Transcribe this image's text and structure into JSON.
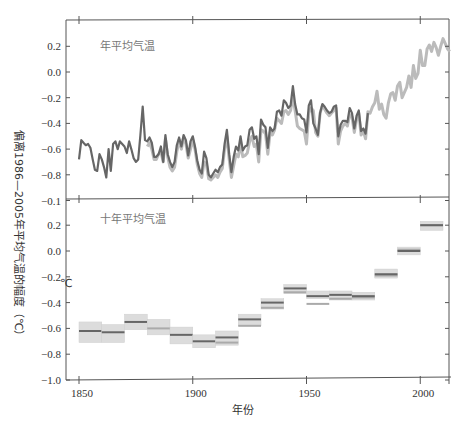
{
  "chart_data": [
    {
      "type": "line",
      "title": "年平均气温",
      "xlabel": "年份",
      "ylabel": "偏离1986—2005年平均气温的幅度（℃）",
      "xlim": [
        1845,
        2014
      ],
      "ylim": [
        -1.0,
        0.4
      ],
      "yticks": [
        0.2,
        0.0,
        -0.2,
        -0.4,
        -0.6,
        -0.8,
        -1.0
      ],
      "ytick_labels": [
        "0.2",
        "0.0",
        "−0.2",
        "−0.4",
        "−0.6",
        "−0.8",
        "−0.1"
      ],
      "xticks": [
        1850,
        1900,
        1950,
        2000
      ],
      "grid": false,
      "legend": null,
      "series": [
        {
          "name": "dataset-dark",
          "color": "#666666",
          "x": [
            1850,
            1851,
            1852,
            1853,
            1854,
            1855,
            1856,
            1857,
            1858,
            1859,
            1860,
            1861,
            1862,
            1863,
            1864,
            1865,
            1866,
            1867,
            1868,
            1869,
            1870,
            1871,
            1872,
            1873,
            1874,
            1875,
            1876,
            1877,
            1878,
            1879,
            1880,
            1881,
            1882,
            1883,
            1884,
            1885,
            1886,
            1887,
            1888,
            1889,
            1890,
            1891,
            1892,
            1893,
            1894,
            1895,
            1896,
            1897,
            1898,
            1899,
            1900,
            1901,
            1902,
            1903,
            1904,
            1905,
            1906,
            1907,
            1908,
            1909,
            1910,
            1911,
            1912,
            1913,
            1914,
            1915,
            1916,
            1917,
            1918,
            1919,
            1920,
            1921,
            1922,
            1923,
            1924,
            1925,
            1926,
            1927,
            1928,
            1929,
            1930,
            1931,
            1932,
            1933,
            1934,
            1935,
            1936,
            1937,
            1938,
            1939,
            1940,
            1941,
            1942,
            1943,
            1944,
            1945,
            1946,
            1947,
            1948,
            1949,
            1950,
            1951,
            1952,
            1953,
            1954,
            1955,
            1956,
            1957,
            1958,
            1959,
            1960,
            1961,
            1962,
            1963,
            1964,
            1965,
            1966,
            1967,
            1968,
            1969,
            1970,
            1971,
            1972,
            1973,
            1974,
            1975,
            1976,
            1977,
            1978,
            1979,
            1980,
            1981,
            1982,
            1983,
            1984,
            1985,
            1986,
            1987,
            1988,
            1989,
            1990,
            1991,
            1992,
            1993,
            1994,
            1995,
            1996,
            1997,
            1998,
            1999,
            2000,
            2001,
            2002,
            2003,
            2004,
            2005,
            2006,
            2007,
            2008,
            2009,
            2010
          ],
          "values": [
            -0.68,
            -0.53,
            -0.55,
            -0.57,
            -0.56,
            -0.59,
            -0.68,
            -0.76,
            -0.77,
            -0.64,
            -0.68,
            -0.74,
            -0.82,
            -0.6,
            -0.77,
            -0.56,
            -0.54,
            -0.6,
            -0.54,
            -0.56,
            -0.58,
            -0.63,
            -0.54,
            -0.6,
            -0.67,
            -0.7,
            -0.68,
            -0.49,
            -0.27,
            -0.53,
            -0.54,
            -0.51,
            -0.55,
            -0.66,
            -0.66,
            -0.64,
            -0.58,
            -0.7,
            -0.49,
            -0.64,
            -0.7,
            -0.74,
            -0.7,
            -0.57,
            -0.51,
            -0.58,
            -0.49,
            -0.53,
            -0.65,
            -0.54,
            -0.5,
            -0.58,
            -0.69,
            -0.76,
            -0.79,
            -0.62,
            -0.67,
            -0.8,
            -0.82,
            -0.79,
            -0.76,
            -0.78,
            -0.74,
            -0.72,
            -0.56,
            -0.45,
            -0.64,
            -0.78,
            -0.66,
            -0.58,
            -0.61,
            -0.5,
            -0.61,
            -0.58,
            -0.57,
            -0.45,
            -0.43,
            -0.52,
            -0.5,
            -0.64,
            -0.37,
            -0.41,
            -0.43,
            -0.59,
            -0.43,
            -0.46,
            -0.44,
            -0.31,
            -0.3,
            -0.34,
            -0.22,
            -0.24,
            -0.28,
            -0.26,
            -0.11,
            -0.25,
            -0.33,
            -0.33,
            -0.36,
            -0.37,
            -0.47,
            -0.26,
            -0.22,
            -0.4,
            -0.44,
            -0.49,
            -0.32,
            -0.25,
            -0.27,
            -0.3,
            -0.32,
            -0.31,
            -0.27,
            -0.26,
            -0.5,
            -0.41,
            -0.38,
            -0.38,
            -0.39,
            -0.28,
            -0.32,
            -0.44,
            -0.34,
            -0.3,
            -0.46,
            -0.44,
            -0.48,
            -0.32
          ],
          "note": "dark series ends ~1977; values estimated from pixels"
        },
        {
          "name": "dataset-light",
          "color": "#bbbbbb",
          "x_start": 1880,
          "x_end": 2010,
          "values": [
            -0.58,
            -0.55,
            -0.6,
            -0.68,
            -0.68,
            -0.64,
            -0.62,
            -0.7,
            -0.52,
            -0.66,
            -0.74,
            -0.77,
            -0.74,
            -0.62,
            -0.53,
            -0.6,
            -0.51,
            -0.56,
            -0.67,
            -0.6,
            -0.53,
            -0.6,
            -0.72,
            -0.79,
            -0.82,
            -0.7,
            -0.72,
            -0.83,
            -0.84,
            -0.82,
            -0.8,
            -0.82,
            -0.78,
            -0.75,
            -0.6,
            -0.5,
            -0.68,
            -0.82,
            -0.73,
            -0.64,
            -0.66,
            -0.56,
            -0.66,
            -0.65,
            -0.63,
            -0.54,
            -0.5,
            -0.58,
            -0.56,
            -0.7,
            -0.45,
            -0.46,
            -0.48,
            -0.64,
            -0.47,
            -0.49,
            -0.45,
            -0.36,
            -0.38,
            -0.4,
            -0.31,
            -0.3,
            -0.33,
            -0.3,
            -0.19,
            -0.3,
            -0.42,
            -0.44,
            -0.45,
            -0.46,
            -0.56,
            -0.32,
            -0.28,
            -0.3,
            -0.47,
            -0.5,
            -0.32,
            -0.26,
            -0.29,
            -0.32,
            -0.34,
            -0.32,
            -0.3,
            -0.28,
            -0.56,
            -0.46,
            -0.42,
            -0.4,
            -0.42,
            -0.33,
            -0.35,
            -0.47,
            -0.37,
            -0.32,
            -0.49,
            -0.46,
            -0.52,
            -0.31,
            -0.32,
            -0.27,
            -0.24,
            -0.15,
            -0.29,
            -0.25,
            -0.33,
            -0.36,
            -0.24,
            -0.17,
            -0.16,
            -0.22,
            -0.11,
            -0.08,
            -0.2,
            -0.16,
            -0.12,
            -0.03,
            -0.12,
            0.05,
            -0.05,
            -0.01,
            0.17,
            0.05,
            0.05,
            0.18,
            0.21,
            0.16,
            0.23,
            0.19,
            0.13,
            0.2,
            0.26,
            0.22,
            0.18,
            0.16
          ]
        }
      ]
    },
    {
      "type": "bar",
      "subtype": "decadal-range-boxes",
      "title": "十年平均气温",
      "xlabel": "年份",
      "ylabel": "偏离1986—2005年平均气温的幅度（℃）",
      "unit_label": "℃",
      "xlim": [
        1845,
        2014
      ],
      "ylim": [
        -1.0,
        0.3
      ],
      "yticks": [
        0.2,
        0.0,
        -0.2,
        -0.4,
        -0.6,
        -0.8,
        -1.0
      ],
      "ytick_labels": [
        "0.2",
        "0.0",
        "−0.2",
        "−0.4",
        "−0.6",
        "−0.8",
        "−1.0"
      ],
      "xticks": [
        1850,
        1900,
        1950,
        2000
      ],
      "xtick_labels": [
        "1850",
        "1900",
        "1950",
        "2000"
      ],
      "categories": [
        "1850s",
        "1860s",
        "1870s",
        "1880s",
        "1890s",
        "1900s",
        "1910s",
        "1920s",
        "1930s",
        "1940s",
        "1950s",
        "1960s",
        "1970s",
        "1980s",
        "1990s",
        "2000s"
      ],
      "decade_start": [
        1850,
        1860,
        1870,
        1880,
        1890,
        1900,
        1910,
        1920,
        1930,
        1940,
        1950,
        1960,
        1970,
        1980,
        1990,
        2000
      ],
      "series": [
        {
          "name": "decadal-mean-dark",
          "color": "#666666",
          "values": [
            -0.62,
            -0.63,
            -0.55,
            null,
            -0.65,
            -0.7,
            -0.67,
            -0.53,
            -0.4,
            -0.29,
            -0.35,
            -0.34,
            -0.35,
            -0.18,
            0.0,
            0.2
          ]
        },
        {
          "name": "decadal-mean-light",
          "color": "#aaaaaa",
          "values": [
            null,
            null,
            null,
            -0.6,
            null,
            null,
            -0.71,
            -0.58,
            -0.44,
            -0.32,
            -0.41,
            -0.37,
            -0.36,
            -0.19,
            0.01,
            0.2
          ]
        },
        {
          "name": "uncertainty-high",
          "color": "#dddddd",
          "values": [
            -0.55,
            -0.57,
            -0.49,
            -0.53,
            -0.59,
            -0.65,
            -0.62,
            -0.49,
            -0.37,
            -0.26,
            -0.31,
            -0.31,
            -0.32,
            -0.14,
            0.03,
            0.23
          ]
        },
        {
          "name": "uncertainty-low",
          "color": "#dddddd",
          "values": [
            -0.71,
            -0.71,
            -0.61,
            -0.65,
            -0.72,
            -0.75,
            -0.73,
            -0.58,
            -0.45,
            -0.33,
            -0.37,
            -0.38,
            -0.38,
            -0.21,
            -0.03,
            0.16
          ]
        }
      ]
    }
  ],
  "labels": {
    "top_title": "年平均气温",
    "bottom_title": "十年平均气温",
    "xlabel": "年份",
    "ylabel": "偏离1986—2005年平均气温的幅度（℃）",
    "unit": "℃",
    "top_yticks": [
      "0.2",
      "0.0",
      "−0.2",
      "−0.4",
      "−0.6",
      "−0.8",
      "−0.1"
    ],
    "bottom_yticks": [
      "0.2",
      "0.0",
      "−0.2",
      "−0.4",
      "−0.6",
      "−0.8",
      "−1.0"
    ],
    "xticks": [
      "1850",
      "1900",
      "1950",
      "2000"
    ]
  }
}
